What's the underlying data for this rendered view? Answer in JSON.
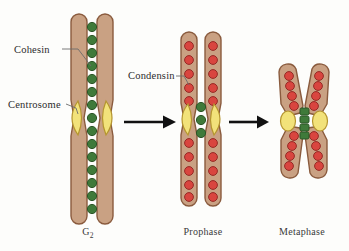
{
  "figure": {
    "background_color": "#fdfdfb"
  },
  "palette": {
    "chromatid_fill": "#c9a183",
    "chromatid_stroke": "#8a5b3e",
    "cohesin_fill": "#3f7a3a",
    "cohesin_stroke": "#2c5527",
    "condensin_fill": "#d9453f",
    "condensin_stroke": "#962a25",
    "centromere_fill": "#f2e27a",
    "centromere_stroke": "#b5952f",
    "arrow_color": "#111111",
    "leader_line_color": "#6b6b6b",
    "text_color": "#2b2b2b"
  },
  "callouts": [
    {
      "id": "cohesin",
      "label": "Cohesin",
      "points_to": "cohesin-dot-g2"
    },
    {
      "id": "centrosome",
      "label": "Centrosome",
      "points_to": "centromere-g2-left"
    },
    {
      "id": "condensin",
      "label": "Condensin",
      "points_to": "condensin-dot-prophase"
    }
  ],
  "stages": [
    {
      "id": "g2",
      "label": "G",
      "label_sub": "2",
      "description": "Long uncondensed sister chromatids joined along their length by cohesin",
      "cohesin_count": 14,
      "condensin_count": 0,
      "centromere_count": 2
    },
    {
      "id": "prophase",
      "label": "Prophase",
      "description": "Shortened chromatids packed with condensin; cohesin remains at the centromere",
      "cohesin_count": 3,
      "condensin_count": 22,
      "centromere_count": 2
    },
    {
      "id": "metaphase",
      "label": "Metaphase",
      "description": "Fully condensed X-shaped chromosome with cohesin only at the centromere",
      "cohesin_count": 4,
      "condensin_count": 20,
      "centromere_count": 2
    }
  ],
  "arrows": [
    {
      "id": "arrow-g2-to-prophase",
      "from": "g2",
      "to": "prophase"
    },
    {
      "id": "arrow-prophase-to-metaphase",
      "from": "prophase",
      "to": "metaphase"
    }
  ]
}
